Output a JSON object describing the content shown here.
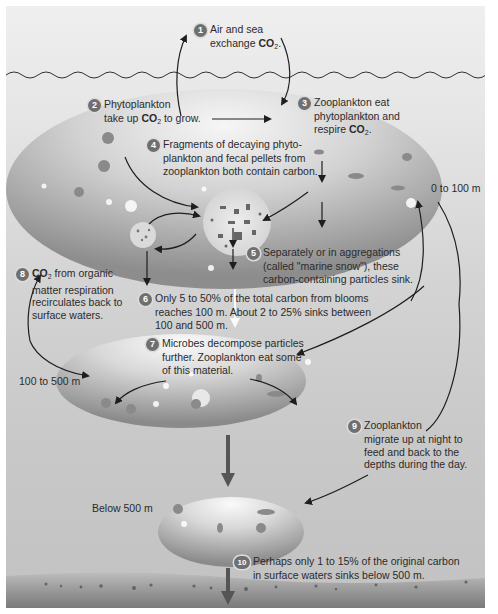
{
  "diagram": {
    "colors": {
      "background_top": "#efefef",
      "background_bottom": "#c2c2c2",
      "zone_fill": "#9a9a9a",
      "zone_highlight": "#f4f4f4",
      "arrow": "#1e1e1e",
      "sink_arrow": "#555555",
      "badge": "#6f6f6f",
      "seafloor": "#8a8a8a"
    },
    "depth_labels": {
      "surface_zone": "0 to 100 m",
      "mid_zone": "100 to 500 m",
      "deep_zone": "Below 500 m"
    },
    "steps": [
      {
        "number": "1",
        "text_pre": "Air and sea",
        "text_line2": "exchange ",
        "bold": "CO",
        "sub": "2",
        "text_post": "."
      },
      {
        "number": "2",
        "text_pre": "Phytoplankton",
        "text_line2": "take up ",
        "bold": "CO",
        "sub": "2",
        "text_post": " to grow."
      },
      {
        "number": "3",
        "text_pre": "Zooplankton eat",
        "text_line2": "phytoplankton and",
        "text_line3": "respire ",
        "bold": "CO",
        "sub": "2",
        "text_post": "."
      },
      {
        "number": "4",
        "lines": [
          "Fragments of decaying phyto-",
          "plankton and fecal pellets from",
          "zooplankton both contain carbon."
        ]
      },
      {
        "number": "5",
        "lines": [
          "Separately or in aggregations",
          "(called \"marine snow\"), these",
          "carbon-containing particles sink."
        ]
      },
      {
        "number": "6",
        "lines": [
          "Only 5 to 50% of the total carbon from blooms",
          "reaches 100 m. About 2 to 25% sinks between",
          "100 and 500 m."
        ]
      },
      {
        "number": "7",
        "lines": [
          "Microbes decompose particles",
          "further. Zooplankton eat some",
          "of this material."
        ]
      },
      {
        "number": "8",
        "bold": "CO",
        "sub": "2",
        "text_post": " from organic",
        "lines": [
          "matter respiration",
          "recirculates back to",
          "surface waters."
        ]
      },
      {
        "number": "9",
        "lines": [
          "Zooplankton",
          "migrate up at night to",
          "feed and back to the",
          "depths during the day."
        ]
      },
      {
        "number": "10",
        "lines": [
          "Perhaps only 1 to 15% of the original carbon",
          "in surface waters sinks below 500 m."
        ]
      }
    ]
  }
}
